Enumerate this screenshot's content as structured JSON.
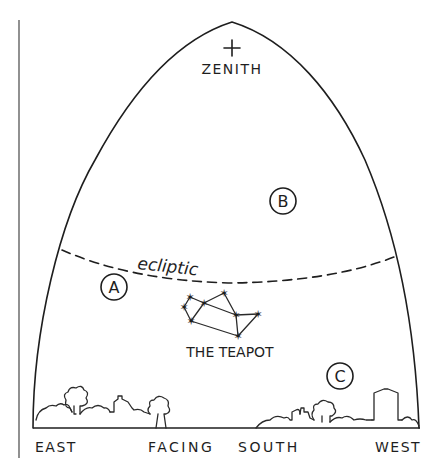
{
  "diagram": {
    "zenith": {
      "label": "ZENITH",
      "marker": "+"
    },
    "ecliptic": {
      "label": "ecliptic",
      "style": "dashed"
    },
    "markers": [
      {
        "id": "A",
        "label": "A"
      },
      {
        "id": "B",
        "label": "B"
      },
      {
        "id": "C",
        "label": "C"
      }
    ],
    "constellation": {
      "label": "THE TEAPOT",
      "star_count": 8
    },
    "directions": {
      "east": "EAST",
      "facing": "FACING",
      "south": "SOUTH",
      "west": "WEST"
    },
    "colors": {
      "ink": "#1e1e1e",
      "background": "#ffffff"
    }
  }
}
